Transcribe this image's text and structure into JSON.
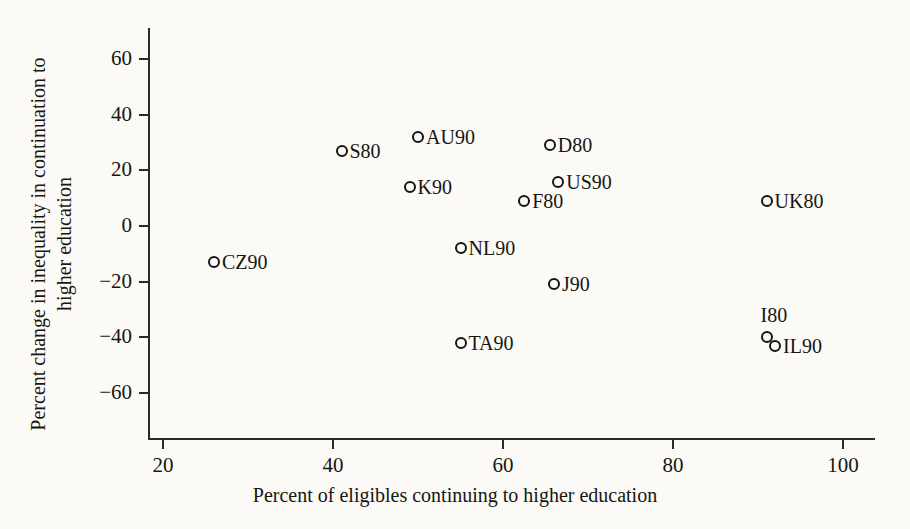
{
  "chart_data": {
    "type": "scatter",
    "title": "",
    "xlabel": "Percent of eligibles continuing to higher education",
    "ylabel_line1": "Percent change in inequality in continuation to",
    "ylabel_line2": "higher education",
    "xlim": [
      14,
      104
    ],
    "ylim": [
      -60,
      68
    ],
    "xticks": [
      20,
      40,
      60,
      80,
      100
    ],
    "xticklabels": [
      "20",
      "40",
      "60",
      "80",
      "100"
    ],
    "yticks": [
      -60,
      -40,
      -20,
      0,
      20,
      40,
      60
    ],
    "yticklabels": [
      "−60",
      "−40",
      "−20",
      "0",
      "20",
      "40",
      "60"
    ],
    "grid": false,
    "legend": "none",
    "marker": "open-circle",
    "points": [
      {
        "label": "CZ90",
        "x": 26,
        "y": -13,
        "label_pos": "right"
      },
      {
        "label": "S80",
        "x": 41,
        "y": 27,
        "label_pos": "right"
      },
      {
        "label": "K90",
        "x": 49,
        "y": 14,
        "label_pos": "right"
      },
      {
        "label": "AU90",
        "x": 50,
        "y": 32,
        "label_pos": "right"
      },
      {
        "label": "NL90",
        "x": 55,
        "y": -8,
        "label_pos": "right"
      },
      {
        "label": "TA90",
        "x": 55,
        "y": -42,
        "label_pos": "right"
      },
      {
        "label": "F80",
        "x": 62.5,
        "y": 9,
        "label_pos": "right"
      },
      {
        "label": "D80",
        "x": 65.5,
        "y": 29,
        "label_pos": "right"
      },
      {
        "label": "J90",
        "x": 66,
        "y": -21,
        "label_pos": "right"
      },
      {
        "label": "US90",
        "x": 66.5,
        "y": 16,
        "label_pos": "right"
      },
      {
        "label": "UK80",
        "x": 91,
        "y": 9,
        "label_pos": "right"
      },
      {
        "label": "I80",
        "x": 91,
        "y": -40,
        "label_pos": "above"
      },
      {
        "label": "IL90",
        "x": 92,
        "y": -43,
        "label_pos": "right"
      }
    ]
  }
}
